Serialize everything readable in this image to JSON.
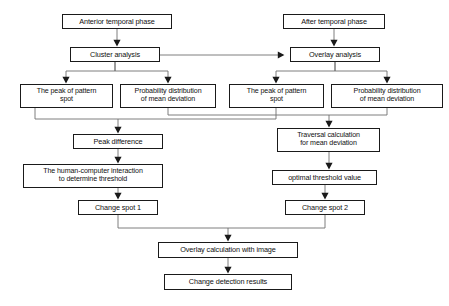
{
  "diagram": {
    "style": {
      "stroke": "#1a1a1a",
      "edge_stroke": "#6f6f6f",
      "background": "#ffffff",
      "text_color": "#111111"
    },
    "nodes": [
      {
        "id": "anterior_phase",
        "label": "Anterior temporal phase",
        "x": 62,
        "y": 14,
        "w": 110,
        "h": 15,
        "size": "fs72"
      },
      {
        "id": "after_phase",
        "label": "After temporal phase",
        "x": 283,
        "y": 14,
        "w": 102,
        "h": 15,
        "size": "fs72"
      },
      {
        "id": "cluster_analysis",
        "label": "Cluster analysis",
        "x": 70,
        "y": 47,
        "w": 90,
        "h": 15,
        "size": "fs72"
      },
      {
        "id": "overlay_analysis",
        "label": "Overlay analysis",
        "x": 290,
        "y": 47,
        "w": 90,
        "h": 15,
        "size": "fs72"
      },
      {
        "id": "peak_left",
        "label": "The peak of pattern\nspot",
        "x": 20,
        "y": 84,
        "w": 93,
        "h": 24,
        "size": "fs7"
      },
      {
        "id": "prob_left",
        "label": "Probability distribution\nof mean deviation",
        "x": 120,
        "y": 84,
        "w": 96,
        "h": 24,
        "size": "fs7"
      },
      {
        "id": "peak_right",
        "label": "The peak of pattern\nspot",
        "x": 229,
        "y": 84,
        "w": 95,
        "h": 24,
        "size": "fs7"
      },
      {
        "id": "prob_right",
        "label": "Probability distribution\nof mean deviation",
        "x": 331,
        "y": 84,
        "w": 112,
        "h": 24,
        "size": "fs7"
      },
      {
        "id": "peak_difference",
        "label": "Peak difference",
        "x": 73,
        "y": 134,
        "w": 90,
        "h": 15,
        "size": "fs72"
      },
      {
        "id": "traversal_calc",
        "label": "Traversal calculation\nfor mean deviation",
        "x": 277,
        "y": 128,
        "w": 103,
        "h": 24,
        "size": "fs7"
      },
      {
        "id": "human_threshold",
        "label": "The human-computer interaction\nto determine threshold",
        "x": 23,
        "y": 164,
        "w": 140,
        "h": 24,
        "size": "fs7"
      },
      {
        "id": "optimal_value",
        "label": "optimal threshold value",
        "x": 272,
        "y": 170,
        "w": 105,
        "h": 15,
        "size": "fs72"
      },
      {
        "id": "change_spot_1",
        "label": "Change spot 1",
        "x": 78,
        "y": 200,
        "w": 80,
        "h": 15,
        "size": "fs72"
      },
      {
        "id": "change_spot_2",
        "label": "Change spot 2",
        "x": 285,
        "y": 200,
        "w": 80,
        "h": 15,
        "size": "fs72"
      },
      {
        "id": "overlay_calc",
        "label": "Overlay calculation with image",
        "x": 158,
        "y": 242,
        "w": 140,
        "h": 16,
        "size": "fs72"
      },
      {
        "id": "change_results",
        "label": "Change detection results",
        "x": 164,
        "y": 274,
        "w": 128,
        "h": 16,
        "size": "fs72"
      }
    ],
    "edges": [
      {
        "id": "anterior-to-cluster",
        "from": "anterior_phase",
        "to": "cluster_analysis",
        "path": "M117,29 L117,45",
        "arrow": "down"
      },
      {
        "id": "after-to-overlay",
        "from": "after_phase",
        "to": "overlay_analysis",
        "path": "M334,29 L334,45",
        "arrow": "down"
      },
      {
        "id": "cluster-to-overlay",
        "from": "cluster_analysis",
        "to": "overlay_analysis",
        "path": "M160,55 L283,55",
        "arrow": "right"
      },
      {
        "id": "cluster-to-peak-left",
        "from": "cluster_analysis",
        "to": "peak_left",
        "path": "M115,62 L115,71 L66,71 L66,82",
        "arrow": "down"
      },
      {
        "id": "cluster-to-prob-left",
        "from": "cluster_analysis",
        "to": "prob_left",
        "path": "M115,62 L115,71 L168,71 L168,82",
        "arrow": "down"
      },
      {
        "id": "overlay-to-peak-right",
        "from": "overlay_analysis",
        "to": "peak_right",
        "path": "M335,62 L335,71 L276,71 L276,82",
        "arrow": "down"
      },
      {
        "id": "overlay-to-prob-right",
        "from": "overlay_analysis",
        "to": "prob_right",
        "path": "M335,62 L335,71 L387,71 L387,82",
        "arrow": "down"
      },
      {
        "id": "peakleft-to-difference",
        "from": "peak_left",
        "to": "peak_difference",
        "path": "M35,108 L35,119 L118,119 L118,132",
        "arrow": "down"
      },
      {
        "id": "peakright-to-difference",
        "from": "peak_right",
        "to": "peak_difference",
        "path": "M276,108 L276,119 L118,119",
        "arrow": "none"
      },
      {
        "id": "probleft-to-traversal",
        "from": "prob_left",
        "to": "traversal_calc",
        "path": "M168,108 L168,115 L329,115 L329,126",
        "arrow": "down"
      },
      {
        "id": "probright-to-traversal",
        "from": "prob_right",
        "to": "traversal_calc",
        "path": "M387,108 L387,115 L329,115",
        "arrow": "none"
      },
      {
        "id": "difference-to-human",
        "from": "peak_difference",
        "to": "human_threshold",
        "path": "M118,149 L118,162",
        "arrow": "down"
      },
      {
        "id": "traversal-to-optimal",
        "from": "traversal_calc",
        "to": "optimal_value",
        "path": "M329,152 L329,168",
        "arrow": "down"
      },
      {
        "id": "human-to-spot1",
        "from": "human_threshold",
        "to": "change_spot_1",
        "path": "M118,188 L118,198",
        "arrow": "down"
      },
      {
        "id": "optimal-to-spot2",
        "from": "optimal_value",
        "to": "change_spot_2",
        "path": "M325,185 L325,198",
        "arrow": "down"
      },
      {
        "id": "spot1-to-overlaycalc",
        "from": "change_spot_1",
        "to": "overlay_calc",
        "path": "M118,215 L118,228 L228,228 L228,240",
        "arrow": "down"
      },
      {
        "id": "spot2-to-overlaycalc",
        "from": "change_spot_2",
        "to": "overlay_calc",
        "path": "M325,215 L325,228 L228,228",
        "arrow": "none"
      },
      {
        "id": "overlaycalc-to-results",
        "from": "overlay_calc",
        "to": "change_results",
        "path": "M228,258 L228,272",
        "arrow": "down"
      }
    ]
  }
}
